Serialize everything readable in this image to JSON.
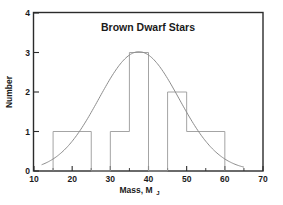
{
  "chart_data": {
    "type": "bar",
    "title": "Brown Dwarf Stars",
    "xlabel": "Mass, M",
    "xlabel_subscript": "J",
    "ylabel": "Number",
    "xlim": [
      10,
      70
    ],
    "ylim": [
      0,
      4
    ],
    "grid": false,
    "legend": "none",
    "xticks": [
      10,
      20,
      30,
      40,
      50,
      60,
      70
    ],
    "xtick_labels": [
      "10",
      "20",
      "30",
      "40",
      "50",
      "60",
      "70"
    ],
    "xticks_minor": [
      15,
      25,
      35,
      45,
      55,
      65
    ],
    "yticks": [
      0,
      1,
      2,
      3,
      4
    ],
    "ytick_labels": [
      "0",
      "1",
      "2",
      "3",
      "4"
    ],
    "bins": [
      {
        "start": 15,
        "end": 25,
        "value": 1
      },
      {
        "start": 25,
        "end": 30,
        "value": 0
      },
      {
        "start": 30,
        "end": 35,
        "value": 1
      },
      {
        "start": 35,
        "end": 40,
        "value": 3
      },
      {
        "start": 40,
        "end": 45,
        "value": 0
      },
      {
        "start": 45,
        "end": 50,
        "value": 2
      },
      {
        "start": 50,
        "end": 60,
        "value": 1
      }
    ],
    "categories": [
      "15-25",
      "25-30",
      "30-35",
      "35-40",
      "40-45",
      "45-50",
      "50-60"
    ],
    "values": [
      1,
      0,
      1,
      3,
      0,
      2,
      1
    ],
    "overlay_curve": {
      "type": "line",
      "name": "gaussian fit",
      "peak_x": 37.5,
      "peak_y": 3.02,
      "sigma": 10.5,
      "x_start": 12,
      "x_end": 65,
      "color": "#8d8d8d"
    },
    "colors": {
      "frame": "#2b2b2b",
      "bar_outline": "#9a9a9a",
      "curve": "#8d8d8d",
      "text": "#1a1a1a",
      "background": "#ffffff"
    }
  }
}
